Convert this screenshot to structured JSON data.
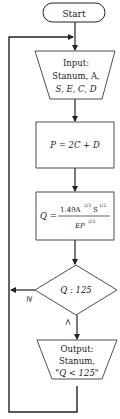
{
  "flowchart": {
    "start": {
      "label": "Start"
    },
    "input": {
      "line1": "Input:",
      "line2": "Stanum, A,",
      "line3": "S, E, C, D"
    },
    "process_p": {
      "formula": "P = 2C + D"
    },
    "process_q": {
      "lhs": "Q =",
      "numerator": "1.49A",
      "numerator_exp1": "2/3",
      "numerator_s": "S",
      "numerator_exp2": "1/2",
      "denominator": "EP",
      "denominator_exp": "2/3"
    },
    "decision": {
      "label": "Q : 125",
      "branch_left": "≥",
      "branch_down": "<"
    },
    "output": {
      "line1": "Output:",
      "line2": "Stanum,",
      "line3": "\"Q < 125\""
    }
  },
  "colors": {
    "stroke": "#222222",
    "background": "#ffffff"
  }
}
